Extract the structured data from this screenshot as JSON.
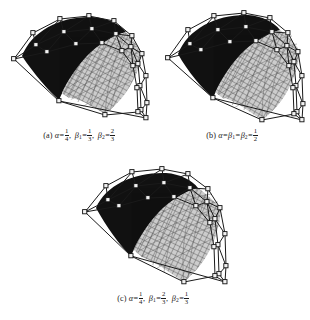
{
  "document": {
    "type": "figure-plate",
    "background_color": "#ffffff",
    "ink_color": "#1a1a1a"
  },
  "figures": [
    {
      "id": "a",
      "label": "(a)",
      "caption_plain": "(a) α = 1/4, β₁ = 1/3, β₂ = 2/3",
      "parameters": [
        {
          "symbol": "α",
          "subscript": "",
          "numerator": "1",
          "denominator": "4"
        },
        {
          "symbol": "β",
          "subscript": "1",
          "numerator": "1",
          "denominator": "3"
        },
        {
          "symbol": "β",
          "subscript": "2",
          "numerator": "2",
          "denominator": "3"
        }
      ],
      "surface": {
        "description": "saddle-shaped spline surface patch with control net",
        "dark_region_color": "#101010",
        "mesh_region_color": "#8c8c8c",
        "control_net_color": "#1a1a1a"
      }
    },
    {
      "id": "b",
      "label": "(b)",
      "caption_plain": "(b) α = β₁ = β₂ = 1/2",
      "parameters": [
        {
          "symbol": "α",
          "subscript": "",
          "numerator": "",
          "denominator": ""
        },
        {
          "symbol": "β",
          "subscript": "1",
          "numerator": "",
          "denominator": ""
        },
        {
          "symbol": "β",
          "subscript": "2",
          "numerator": "1",
          "denominator": "2"
        }
      ],
      "surface": {
        "description": "saddle-shaped spline surface patch with control net",
        "dark_region_color": "#101010",
        "mesh_region_color": "#8c8c8c",
        "control_net_color": "#1a1a1a"
      }
    },
    {
      "id": "c",
      "label": "(c)",
      "caption_plain": "(c) α = 1/4, β₁ = 2/3, β₂ = 1/3",
      "parameters": [
        {
          "symbol": "α",
          "subscript": "",
          "numerator": "1",
          "denominator": "4"
        },
        {
          "symbol": "β",
          "subscript": "1",
          "numerator": "2",
          "denominator": "3"
        },
        {
          "symbol": "β",
          "subscript": "2",
          "numerator": "1",
          "denominator": "3"
        }
      ],
      "surface": {
        "description": "saddle-shaped spline surface patch with control net",
        "dark_region_color": "#101010",
        "mesh_region_color": "#8c8c8c",
        "control_net_color": "#1a1a1a"
      }
    }
  ],
  "symbols": {
    "equals": "=",
    "comma": ",",
    "alpha": "α",
    "beta": "β"
  }
}
